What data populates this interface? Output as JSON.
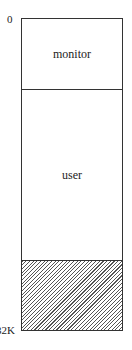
{
  "diagram": {
    "type": "memory-layout",
    "addresses": {
      "top": "0",
      "bottom": "32K"
    },
    "regions": [
      {
        "label": "monitor",
        "fill": "none"
      },
      {
        "label": "user",
        "fill": "none"
      },
      {
        "label": "",
        "fill": "hatched"
      }
    ],
    "colors": {
      "border": "#333333",
      "hatch": "#555555",
      "background": "#ffffff"
    }
  }
}
